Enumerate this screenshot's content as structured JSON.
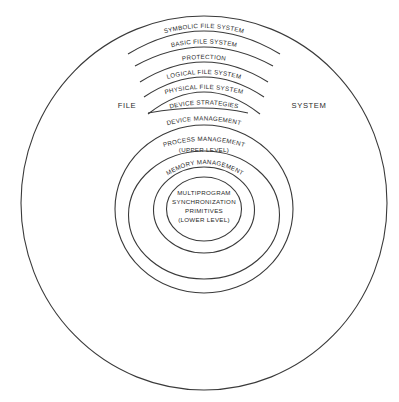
{
  "diagram": {
    "outer_labels": {
      "left": "FILE",
      "right": "SYSTEM"
    },
    "arc_layers": [
      {
        "label": "SYMBOLIC FILE SYSTEM"
      },
      {
        "label": "BASIC FILE SYSTEM"
      },
      {
        "label": "PROTECTION"
      },
      {
        "label": "LOGICAL FILE SYSTEM"
      },
      {
        "label": "PHYSICAL FILE SYSTEM"
      },
      {
        "label": "DEVICE STRATEGIES"
      }
    ],
    "ring_layers": [
      {
        "label": "DEVICE MANAGEMENT"
      },
      {
        "label": "PROCESS MANAGEMENT",
        "sublabel": "(UPPER LEVEL)"
      },
      {
        "label": "MEMORY MANAGEMENT"
      }
    ],
    "core": {
      "lines": [
        "MULTIPROGRAM",
        "SYNCHRONIZATION",
        "PRIMITIVES",
        "(LOWER LEVEL)"
      ]
    },
    "colors": {
      "line": "#3a3a3a",
      "text": "#2a2a2a",
      "background": "#ffffff"
    }
  }
}
